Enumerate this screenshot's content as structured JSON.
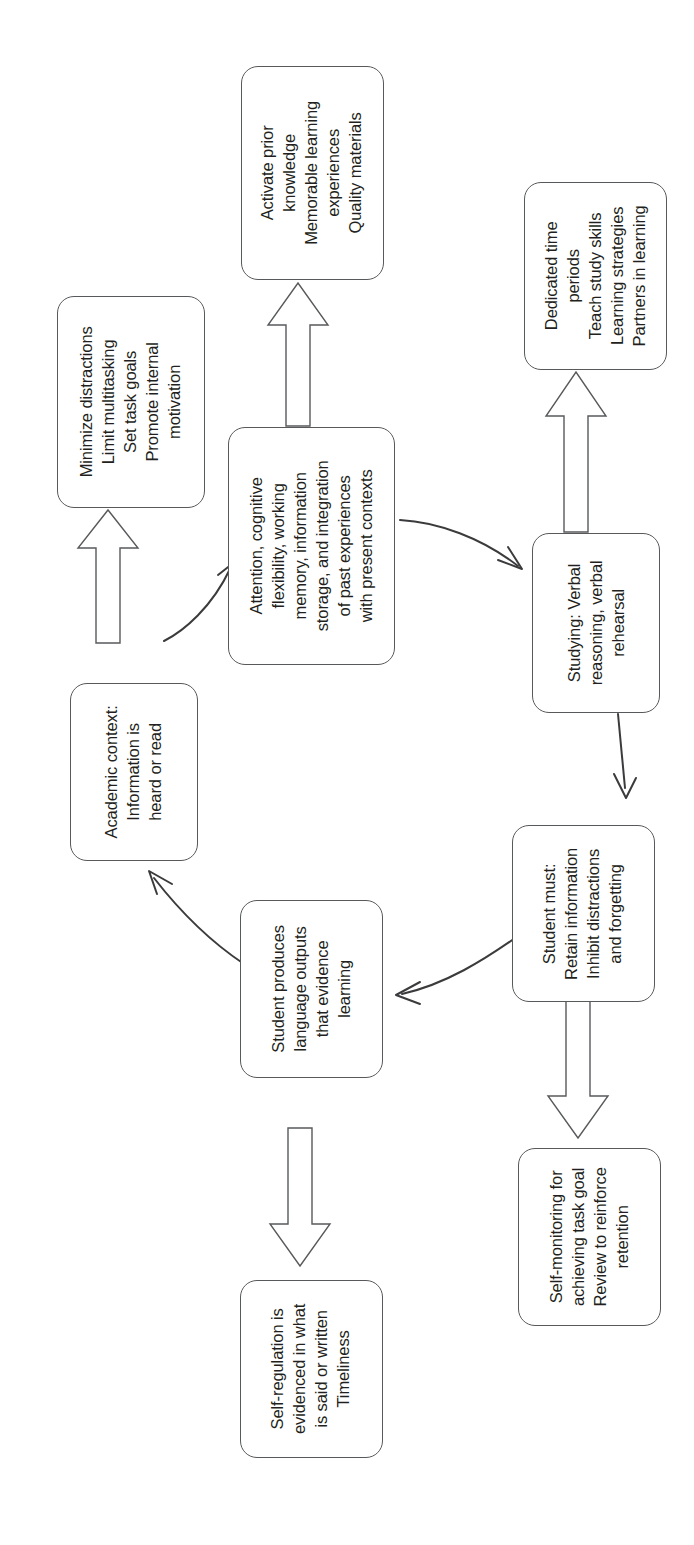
{
  "diagram": {
    "orientation": "rotated-90-ccw",
    "canvas": {
      "width": 694,
      "height": 1545
    },
    "style": {
      "box_border_color": "#58595b",
      "box_fill_color": "#ffffff",
      "text_color": "#231f20",
      "arrow_color": "#3b3b3d",
      "background_color": "#ffffff"
    },
    "nodes": [
      {
        "id": "activate-prior-knowledge",
        "lines": [
          "Activate prior",
          "knowledge",
          "Memorable learning",
          "experiences",
          "Quality materials"
        ]
      },
      {
        "id": "dedicated-time-periods",
        "lines": [
          "Dedicated time",
          "periods",
          "Teach study skills",
          "Learning strategies",
          "Partners in learning"
        ]
      },
      {
        "id": "minimize-distractions",
        "lines": [
          "Minimize distractions",
          "Limit multitasking",
          "Set task goals",
          "Promote internal",
          "motivation"
        ]
      },
      {
        "id": "attention-cognitive-flexibility",
        "lines": [
          "Attention, cognitive",
          "flexibility, working",
          "memory, information",
          "storage, and integration",
          "of past experiences",
          "with present contexts"
        ]
      },
      {
        "id": "studying-verbal-reasoning",
        "lines": [
          "Studying: Verbal",
          "reasoning, verbal",
          "rehearsal"
        ]
      },
      {
        "id": "academic-context",
        "lines": [
          "Academic context:",
          "Information is",
          "heard or read"
        ]
      },
      {
        "id": "student-must-retain",
        "lines": [
          "Student must:",
          "Retain information",
          "Inhibit distractions",
          "and forgetting"
        ]
      },
      {
        "id": "student-produces-language-outputs",
        "lines": [
          "Student produces",
          "language outputs",
          "that evidence",
          "learning"
        ]
      },
      {
        "id": "self-monitoring",
        "lines": [
          "Self-monitoring for",
          "achieving task goal",
          "Review to reinforce",
          "retention"
        ]
      },
      {
        "id": "self-regulation-evidenced",
        "lines": [
          "Self-regulation is",
          "evidenced in what",
          "is said or written",
          "Timeliness"
        ]
      }
    ],
    "connectors": [
      {
        "id": "academic-context-to-minimize-distractions",
        "kind": "block-arrow",
        "direction": "up"
      },
      {
        "id": "academic-context-to-attention",
        "kind": "thin-curved-arrow",
        "direction": "up-right"
      },
      {
        "id": "attention-to-activate-prior-knowledge",
        "kind": "block-arrow",
        "direction": "up"
      },
      {
        "id": "attention-to-studying",
        "kind": "thin-curved-arrow",
        "direction": "right-down"
      },
      {
        "id": "studying-to-dedicated-time-periods",
        "kind": "block-arrow",
        "direction": "up"
      },
      {
        "id": "studying-to-student-must",
        "kind": "thin-straight-arrow",
        "direction": "down"
      },
      {
        "id": "student-must-to-student-produces",
        "kind": "thin-curved-arrow",
        "direction": "left"
      },
      {
        "id": "student-must-to-self-monitoring",
        "kind": "block-arrow",
        "direction": "down"
      },
      {
        "id": "student-produces-to-academic-context",
        "kind": "thin-curved-arrow",
        "direction": "up-left"
      },
      {
        "id": "student-produces-to-self-regulation",
        "kind": "block-arrow",
        "direction": "down"
      }
    ]
  }
}
